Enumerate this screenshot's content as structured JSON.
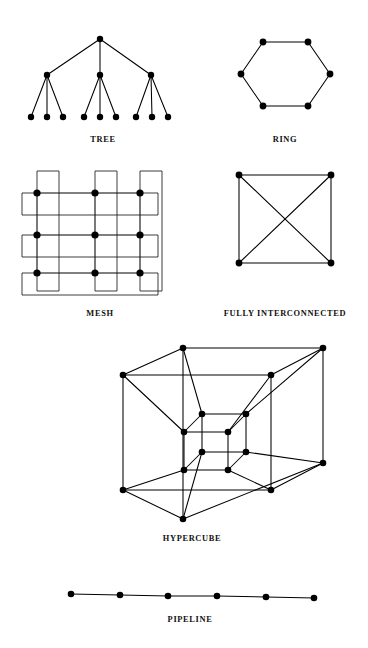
{
  "figure": {
    "background_color": "#ffffff",
    "ink_color": "#000000",
    "node_radius": 3.4,
    "node_radius_small": 3.0
  },
  "captions": {
    "tree": "TREE",
    "ring": "RING",
    "mesh": "MESH",
    "fully_interconnected": "FULLY  INTERCONNECTED",
    "hypercube": "HYPERCUBE",
    "pipeline": "PIPELINE"
  },
  "chart_data": {
    "type": "diagram",
    "panels": [
      {
        "id": "tree",
        "label": "TREE",
        "label_pos": [
          103,
          142
        ],
        "node_count": 13,
        "edge_count": 12,
        "description": "Rooted tree, one root, three interior nodes, nine leaves",
        "nodes": [
          {
            "id": "root",
            "x": 100,
            "y": 39
          },
          {
            "id": "m1",
            "x": 47,
            "y": 75
          },
          {
            "id": "m2",
            "x": 100,
            "y": 75
          },
          {
            "id": "m3",
            "x": 151,
            "y": 75
          },
          {
            "id": "l1",
            "x": 31,
            "y": 117
          },
          {
            "id": "l2",
            "x": 47,
            "y": 117
          },
          {
            "id": "l3",
            "x": 63,
            "y": 117
          },
          {
            "id": "l4",
            "x": 84,
            "y": 117
          },
          {
            "id": "l5",
            "x": 100,
            "y": 117
          },
          {
            "id": "l6",
            "x": 116,
            "y": 117
          },
          {
            "id": "l7",
            "x": 136,
            "y": 117
          },
          {
            "id": "l8",
            "x": 152,
            "y": 117
          },
          {
            "id": "l9",
            "x": 168,
            "y": 117
          }
        ],
        "edges": [
          [
            "root",
            "m1"
          ],
          [
            "root",
            "m2"
          ],
          [
            "root",
            "m3"
          ],
          [
            "m1",
            "l1"
          ],
          [
            "m1",
            "l2"
          ],
          [
            "m1",
            "l3"
          ],
          [
            "m2",
            "l4"
          ],
          [
            "m2",
            "l5"
          ],
          [
            "m2",
            "l6"
          ],
          [
            "m3",
            "l7"
          ],
          [
            "m3",
            "l8"
          ],
          [
            "m3",
            "l9"
          ]
        ]
      },
      {
        "id": "ring",
        "label": "RING",
        "label_pos": [
          285,
          142
        ],
        "node_count": 6,
        "edge_count": 6,
        "description": "Hexagonal ring of six nodes",
        "nodes": [
          {
            "id": "r1",
            "x": 263,
            "y": 42
          },
          {
            "id": "r2",
            "x": 308,
            "y": 42
          },
          {
            "id": "r3",
            "x": 330,
            "y": 74
          },
          {
            "id": "r4",
            "x": 308,
            "y": 106
          },
          {
            "id": "r5",
            "x": 263,
            "y": 106
          },
          {
            "id": "r6",
            "x": 241,
            "y": 74
          }
        ],
        "edges": [
          [
            "r1",
            "r2"
          ],
          [
            "r2",
            "r3"
          ],
          [
            "r3",
            "r4"
          ],
          [
            "r4",
            "r5"
          ],
          [
            "r5",
            "r6"
          ],
          [
            "r6",
            "r1"
          ]
        ]
      },
      {
        "id": "mesh",
        "label": "MESH",
        "label_pos": [
          100,
          316
        ],
        "node_count": 9,
        "description": "Three by three torus mesh with wrap-around links on rows and columns",
        "nodes": [
          {
            "id": "n00",
            "x": 37,
            "y": 193
          },
          {
            "id": "n01",
            "x": 95,
            "y": 193
          },
          {
            "id": "n02",
            "x": 140,
            "y": 193
          },
          {
            "id": "n10",
            "x": 37,
            "y": 235
          },
          {
            "id": "n11",
            "x": 95,
            "y": 235
          },
          {
            "id": "n12",
            "x": 140,
            "y": 235
          },
          {
            "id": "n20",
            "x": 37,
            "y": 273
          },
          {
            "id": "n21",
            "x": 95,
            "y": 273
          },
          {
            "id": "n22",
            "x": 140,
            "y": 273
          }
        ],
        "row_wrap": [
          {
            "row": 0,
            "left_x": 22,
            "right_x": 158,
            "y": 193,
            "offset": 22
          },
          {
            "row": 1,
            "left_x": 22,
            "right_x": 158,
            "y": 235,
            "offset": 22
          },
          {
            "row": 2,
            "left_x": 22,
            "right_x": 158,
            "y": 273,
            "offset": 22
          }
        ],
        "col_wrap": [
          {
            "col": 0,
            "x": 37,
            "top_y": 193,
            "bottom_y": 273,
            "offset": 22
          },
          {
            "col": 1,
            "x": 95,
            "top_y": 193,
            "bottom_y": 273,
            "offset": 22
          },
          {
            "col": 2,
            "x": 140,
            "top_y": 193,
            "bottom_y": 273,
            "offset": 22
          }
        ]
      },
      {
        "id": "fully_interconnected",
        "label": "FULLY  INTERCONNECTED",
        "label_pos": [
          285,
          316
        ],
        "node_count": 4,
        "edge_count": 6,
        "description": "Complete graph K4 drawn as a square with both diagonals",
        "nodes": [
          {
            "id": "f1",
            "x": 239,
            "y": 175
          },
          {
            "id": "f2",
            "x": 331,
            "y": 175
          },
          {
            "id": "f3",
            "x": 331,
            "y": 263
          },
          {
            "id": "f4",
            "x": 239,
            "y": 263
          }
        ],
        "edges": [
          [
            "f1",
            "f2"
          ],
          [
            "f2",
            "f3"
          ],
          [
            "f3",
            "f4"
          ],
          [
            "f4",
            "f1"
          ],
          [
            "f1",
            "f3"
          ],
          [
            "f2",
            "f4"
          ]
        ]
      },
      {
        "id": "hypercube",
        "label": "HYPERCUBE",
        "label_pos": [
          192,
          541
        ],
        "node_count": 16,
        "edge_count": 32,
        "description": "Four dimensional hypercube drawn as an inner cube nested in an outer cube with sixteen corresponding corners joined",
        "nodes": [
          {
            "id": "o_ftl",
            "x": 123,
            "y": 375
          },
          {
            "id": "o_ftr",
            "x": 271,
            "y": 375
          },
          {
            "id": "o_fbr",
            "x": 271,
            "y": 490
          },
          {
            "id": "o_fbl",
            "x": 123,
            "y": 490
          },
          {
            "id": "o_btl",
            "x": 183,
            "y": 348
          },
          {
            "id": "o_btr",
            "x": 323,
            "y": 348
          },
          {
            "id": "o_bbr",
            "x": 323,
            "y": 463
          },
          {
            "id": "o_bbl",
            "x": 183,
            "y": 519
          },
          {
            "id": "i_ftl",
            "x": 184,
            "y": 432
          },
          {
            "id": "i_ftr",
            "x": 228,
            "y": 432
          },
          {
            "id": "i_fbr",
            "x": 228,
            "y": 470
          },
          {
            "id": "i_fbl",
            "x": 184,
            "y": 470
          },
          {
            "id": "i_btl",
            "x": 202,
            "y": 414
          },
          {
            "id": "i_btr",
            "x": 246,
            "y": 414
          },
          {
            "id": "i_bbr",
            "x": 246,
            "y": 452
          },
          {
            "id": "i_bbl",
            "x": 202,
            "y": 452
          }
        ],
        "edges": [
          [
            "o_ftl",
            "o_ftr"
          ],
          [
            "o_ftr",
            "o_fbr"
          ],
          [
            "o_fbr",
            "o_fbl"
          ],
          [
            "o_fbl",
            "o_ftl"
          ],
          [
            "o_btl",
            "o_btr"
          ],
          [
            "o_btr",
            "o_bbr"
          ],
          [
            "o_bbr",
            "o_bbl"
          ],
          [
            "o_bbl",
            "o_btl"
          ],
          [
            "o_ftl",
            "o_btl"
          ],
          [
            "o_ftr",
            "o_btr"
          ],
          [
            "o_fbr",
            "o_bbr"
          ],
          [
            "o_fbl",
            "o_bbl"
          ],
          [
            "i_ftl",
            "i_ftr"
          ],
          [
            "i_ftr",
            "i_fbr"
          ],
          [
            "i_fbr",
            "i_fbl"
          ],
          [
            "i_fbl",
            "i_ftl"
          ],
          [
            "i_btl",
            "i_btr"
          ],
          [
            "i_btr",
            "i_bbr"
          ],
          [
            "i_bbr",
            "i_bbl"
          ],
          [
            "i_bbl",
            "i_btl"
          ],
          [
            "i_ftl",
            "i_btl"
          ],
          [
            "i_ftr",
            "i_btr"
          ],
          [
            "i_fbr",
            "i_bbr"
          ],
          [
            "i_fbl",
            "i_bbl"
          ],
          [
            "o_ftl",
            "i_ftl"
          ],
          [
            "o_ftr",
            "i_ftr"
          ],
          [
            "o_fbr",
            "i_fbr"
          ],
          [
            "o_fbl",
            "i_fbl"
          ],
          [
            "o_btl",
            "i_btl"
          ],
          [
            "o_btr",
            "i_btr"
          ],
          [
            "o_bbr",
            "i_bbr"
          ],
          [
            "o_bbl",
            "i_bbl"
          ]
        ]
      },
      {
        "id": "pipeline",
        "label": "PIPELINE",
        "label_pos": [
          190,
          622
        ],
        "node_count": 6,
        "edge_count": 5,
        "description": "Linear chain of six nodes",
        "nodes": [
          {
            "id": "p1",
            "x": 71,
            "y": 594
          },
          {
            "id": "p2",
            "x": 120,
            "y": 595
          },
          {
            "id": "p3",
            "x": 168,
            "y": 596
          },
          {
            "id": "p4",
            "x": 217,
            "y": 596
          },
          {
            "id": "p5",
            "x": 266,
            "y": 597
          },
          {
            "id": "p6",
            "x": 314,
            "y": 598
          }
        ],
        "edges": [
          [
            "p1",
            "p2"
          ],
          [
            "p2",
            "p3"
          ],
          [
            "p3",
            "p4"
          ],
          [
            "p4",
            "p5"
          ],
          [
            "p5",
            "p6"
          ]
        ]
      }
    ]
  }
}
